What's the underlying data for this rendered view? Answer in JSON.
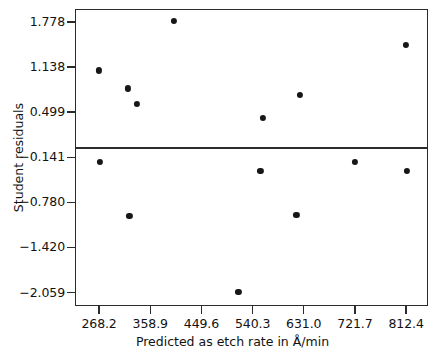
{
  "chart_data": {
    "type": "scatter",
    "title": "",
    "xlabel": "Predicted as etch rate in Å/min",
    "ylabel": "Student residuals",
    "xticks": [
      268.2,
      358.9,
      449.6,
      540.3,
      631.0,
      721.7,
      812.4
    ],
    "xtick_labels": [
      "268.2",
      "358.9",
      "449.6",
      "540.3",
      "631.0",
      "721.7",
      "812.4"
    ],
    "yticks": [
      1.778,
      1.138,
      0.499,
      -0.141,
      -0.78,
      -1.42,
      -2.059
    ],
    "ytick_labels": [
      "1.778",
      "1.138",
      "0.499",
      "−0.141",
      "−0.780",
      "−1.420",
      "−2.059"
    ],
    "xlim": [
      225.5,
      851.2
    ],
    "ylim": [
      -2.25,
      1.96
    ],
    "grid": false,
    "legend": null,
    "reference_line": {
      "y": 0.0,
      "orientation": "horizontal"
    },
    "marker": "filled-circle",
    "marker_color": "#171717",
    "points": [
      {
        "x": 268.2,
        "y": 1.09
      },
      {
        "x": 269.9,
        "y": -0.212
      },
      {
        "x": 319.8,
        "y": 0.834
      },
      {
        "x": 322.0,
        "y": -0.975
      },
      {
        "x": 335.9,
        "y": 0.612
      },
      {
        "x": 401.0,
        "y": 1.792
      },
      {
        "x": 515.0,
        "y": -2.048
      },
      {
        "x": 554.0,
        "y": -0.34
      },
      {
        "x": 558.0,
        "y": 0.416
      },
      {
        "x": 618.0,
        "y": -0.962
      },
      {
        "x": 624.0,
        "y": 0.738
      },
      {
        "x": 721.7,
        "y": -0.205
      },
      {
        "x": 812.4,
        "y": 1.453
      },
      {
        "x": 814.0,
        "y": -0.34
      }
    ]
  }
}
